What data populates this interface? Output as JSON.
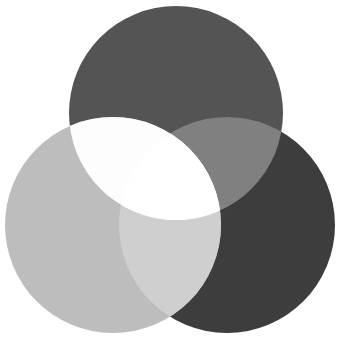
{
  "diagram": {
    "type": "venn-3-circles",
    "background": "#ffffff",
    "circles": [
      {
        "id": "top",
        "cx": 176,
        "cy": 113,
        "r": 107,
        "fill": "#545454"
      },
      {
        "id": "left",
        "cx": 113,
        "cy": 225,
        "r": 108,
        "fill": "#bdbdbd"
      },
      {
        "id": "right",
        "cx": 227,
        "cy": 225,
        "r": 108,
        "fill": "#3d3d3d"
      }
    ],
    "overlaps": {
      "top_right": "#808080",
      "left_right": "#cfcfcf",
      "top_left": "#fdfdfd",
      "center": "#ffffff"
    }
  }
}
